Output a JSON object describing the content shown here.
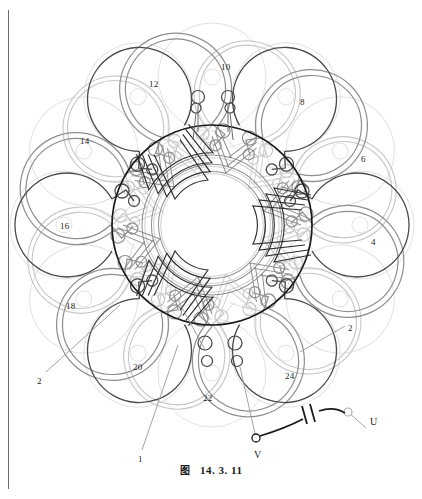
{
  "figure": {
    "caption_cjk": "图",
    "caption_number": "14. 3. 11"
  },
  "diagram": {
    "type": "motor-stator-winding-schematic",
    "core": {
      "cx": 212,
      "cy": 225,
      "r": 100
    },
    "petal_count": 12,
    "labels": [
      {
        "id": "lbl-10",
        "text": "10",
        "x": 221,
        "y": 63
      },
      {
        "id": "lbl-12",
        "text": "12",
        "x": 149,
        "y": 80
      },
      {
        "id": "lbl-8",
        "text": "8",
        "x": 300,
        "y": 98
      },
      {
        "id": "lbl-14",
        "text": "14",
        "x": 80,
        "y": 137
      },
      {
        "id": "lbl-6",
        "text": "6",
        "x": 361,
        "y": 155
      },
      {
        "id": "lbl-16",
        "text": "16",
        "x": 60,
        "y": 222
      },
      {
        "id": "lbl-4",
        "text": "4",
        "x": 371,
        "y": 238
      },
      {
        "id": "lbl-18",
        "text": "18",
        "x": 66,
        "y": 302
      },
      {
        "id": "lbl-2r",
        "text": "2",
        "x": 348,
        "y": 324
      },
      {
        "id": "lbl-20",
        "text": "20",
        "x": 133,
        "y": 363
      },
      {
        "id": "lbl-24",
        "text": "24",
        "x": 285,
        "y": 372
      },
      {
        "id": "lbl-22",
        "text": "22",
        "x": 203,
        "y": 394
      },
      {
        "id": "lbl-2l",
        "text": "2",
        "x": 37,
        "y": 377
      },
      {
        "id": "lbl-1",
        "text": "1",
        "x": 138,
        "y": 455
      }
    ],
    "terminals": [
      {
        "id": "terminal-u",
        "text": "U",
        "x": 370,
        "y": 417
      },
      {
        "id": "terminal-v",
        "text": "V",
        "x": 254,
        "y": 450
      }
    ],
    "component": {
      "name": "capacitor",
      "symbol": "two parallel plates",
      "between": [
        "V",
        "U"
      ]
    },
    "colors": {
      "core_stroke": "#1a1a1a",
      "coil_dark": "#3a3a3a",
      "coil_mid": "#7c7c7c",
      "coil_light": "#bdbdbd",
      "coil_faint": "#dedede",
      "leader_line": "#9a9a9a",
      "text": "#231f20",
      "page_border": "#6e6e6e",
      "background": "#ffffff"
    }
  }
}
